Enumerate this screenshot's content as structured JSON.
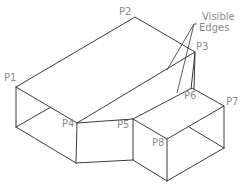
{
  "diagram": {
    "annotation": {
      "line1": "Visible",
      "line2": "Edges"
    },
    "points": [
      {
        "id": "P1",
        "label": "P1",
        "x": 16,
        "y": 87,
        "lx": 4,
        "ly": 81
      },
      {
        "id": "P2",
        "label": "P2",
        "x": 135,
        "y": 17,
        "lx": 119,
        "ly": 15
      },
      {
        "id": "P3",
        "label": "P3",
        "x": 195,
        "y": 52,
        "lx": 196,
        "ly": 50
      },
      {
        "id": "P4",
        "label": "P4",
        "x": 77,
        "y": 123,
        "lx": 62,
        "ly": 127
      },
      {
        "id": "P5",
        "label": "P5",
        "x": 133,
        "y": 119,
        "lx": 117,
        "ly": 128
      },
      {
        "id": "P6",
        "label": "P6",
        "x": 192,
        "y": 88,
        "lx": 184,
        "ly": 99
      },
      {
        "id": "P7",
        "label": "P7",
        "x": 224,
        "y": 106,
        "lx": 226,
        "ly": 105
      },
      {
        "id": "P8",
        "label": "P8",
        "x": 167,
        "y": 139,
        "lx": 152,
        "ly": 146
      }
    ],
    "colors": {
      "edge": "#3a3a3a",
      "label": "#8a8a8a",
      "background": "#ffffff"
    }
  }
}
